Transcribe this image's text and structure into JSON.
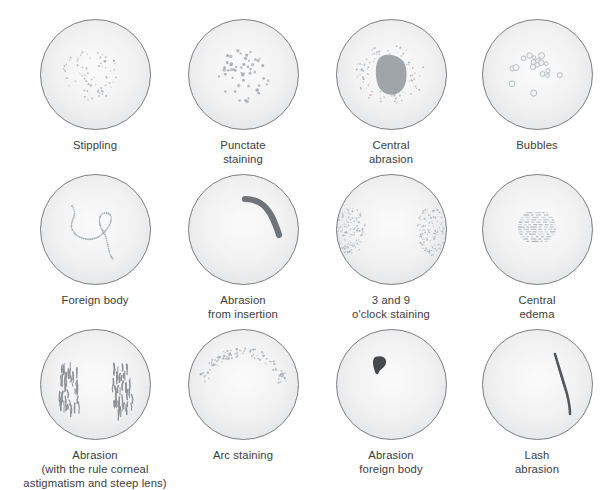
{
  "figure": {
    "columns": 4,
    "rows": 3,
    "background_color": "#ffffff",
    "disc": {
      "fill_center": "#fbfbfb",
      "fill_edge": "#e2e3e4",
      "stroke": "#6f7173",
      "diameter_px": 113
    },
    "mark_color_light": "#a9aeb2",
    "mark_color_dark": "#6a6e72"
  },
  "panels": [
    {
      "id": "stippling",
      "pattern": "scattered-fine-dots-central",
      "caption_lines": [
        "Stippling"
      ],
      "x": 22,
      "y": 18
    },
    {
      "id": "punctate-staining",
      "pattern": "punctate-dots-central",
      "caption_lines": [
        "Punctate",
        "staining"
      ],
      "x": 170,
      "y": 18
    },
    {
      "id": "central-abrasion",
      "pattern": "solid-blob-with-stipple-halo",
      "caption_lines": [
        "Central",
        "abrasion"
      ],
      "x": 318,
      "y": 18
    },
    {
      "id": "bubbles",
      "pattern": "ring-clusters",
      "caption_lines": [
        "Bubbles"
      ],
      "x": 464,
      "y": 18
    },
    {
      "id": "foreign-body",
      "pattern": "meandering-dotted-trail",
      "caption_lines": [
        "Foreign body"
      ],
      "x": 22,
      "y": 173
    },
    {
      "id": "abrasion-from-insertion",
      "pattern": "thick-curved-stroke-upper-right",
      "caption_lines": [
        "Abrasion",
        "from insertion"
      ],
      "x": 170,
      "y": 173
    },
    {
      "id": "three-and-nine-oclock-staining",
      "pattern": "dense-stipple-left-and-right-edges",
      "caption_lines": [
        "3 and 9",
        "o'clock staining"
      ],
      "x": 318,
      "y": 173
    },
    {
      "id": "central-edema",
      "pattern": "horizontal-dash-mosaic-central",
      "caption_lines": [
        "Central",
        "edema"
      ],
      "x": 464,
      "y": 173
    },
    {
      "id": "abrasion-astigmatism",
      "pattern": "two-vertical-stroke-clusters",
      "caption_lines": [
        "Abrasion",
        "(with the rule corneal",
        "astigmatism and steep lens)"
      ],
      "x": 22,
      "y": 328
    },
    {
      "id": "arc-staining",
      "pattern": "arc-band-of-dots-upper",
      "caption_lines": [
        "Arc staining"
      ],
      "x": 170,
      "y": 328
    },
    {
      "id": "abrasion-foreign-body",
      "pattern": "small-dark-comma-blob-upper-left",
      "caption_lines": [
        "Abrasion",
        "foreign body"
      ],
      "x": 318,
      "y": 328
    },
    {
      "id": "lash-abrasion",
      "pattern": "thin-vertical-curved-dark-streak",
      "caption_lines": [
        "Lash",
        "abrasion"
      ],
      "x": 464,
      "y": 328
    }
  ]
}
